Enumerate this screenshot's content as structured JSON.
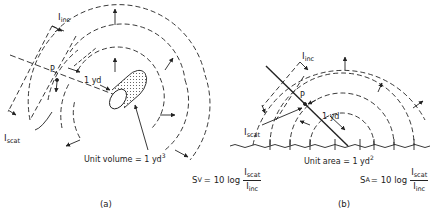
{
  "panel_a": {
    "caption": "(a)",
    "incident_label": "I",
    "incident_sub": "inc",
    "scattered_label": "I",
    "scattered_sub": "scat",
    "point_label": "P",
    "distance_label": "1 yd",
    "unit_label": "Unit volume = 1 yd",
    "unit_sup": "3",
    "formula": {
      "lhs": "S",
      "lhs_sub": "V",
      "eq": " = 10 log",
      "num": "I",
      "num_sub": "scat",
      "den": "I",
      "den_sub": "inc"
    }
  },
  "panel_b": {
    "caption": "(b)",
    "incident_label": "I",
    "incident_sub": "inc",
    "scattered_label": "I",
    "scattered_sub": "scat",
    "point_label": "P",
    "distance_label": "1 yd",
    "unit_label": "Unit area = 1 yd",
    "unit_sup": "2",
    "formula": {
      "lhs": "S",
      "lhs_sub": "A",
      "eq": "= 10 log",
      "num": "I",
      "num_sub": "scat",
      "den": "I",
      "den_sub": "inc"
    }
  },
  "colors": {
    "ink": "#222222",
    "background": "#ffffff"
  }
}
